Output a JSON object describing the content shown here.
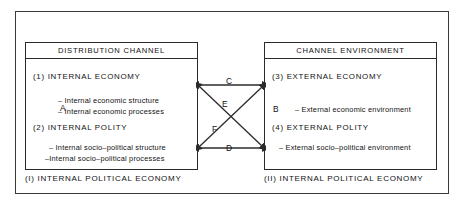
{
  "figure": {
    "left_panel": {
      "header": "DISTRIBUTION CHANNEL",
      "section1_title": "(1) INTERNAL ECONOMY",
      "section1_bullets": [
        "– Internal economic structure",
        "– Internal economic processes"
      ],
      "section2_title": "(2) INTERNAL POLITY",
      "section2_bullets": [
        "– Internal socio–political structure",
        "–Internal socio–political processes"
      ],
      "axis_label": "A",
      "caption": "(I) INTERNAL POLITICAL ECONOMY"
    },
    "right_panel": {
      "header": "CHANNEL ENVIRONMENT",
      "section1_title": "(3) EXTERNAL ECONOMY",
      "section1_bullets": [
        "– External economic environment"
      ],
      "section2_title": "(4) EXTERNAL POLITY",
      "section2_bullets": [
        "– External socio–political environment"
      ],
      "axis_label": "B",
      "caption": "(II) INTERNAL POLITICAL ECONOMY"
    },
    "connectors": {
      "top": "C",
      "diagonal_upper": "E",
      "diagonal_lower": "F",
      "bottom": "D"
    },
    "colors": {
      "line": "#2b2b2b",
      "frame": "#3a3a3a",
      "background": "#ffffff"
    }
  }
}
